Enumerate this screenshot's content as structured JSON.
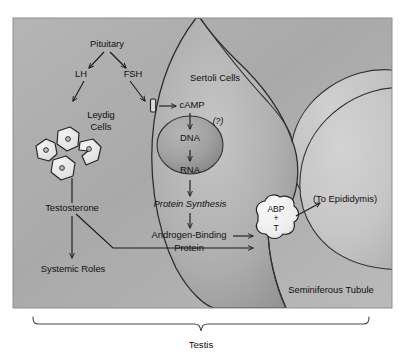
{
  "figure": {
    "caption": "Testis",
    "frame": {
      "x": 13,
      "y": 18,
      "width": 379,
      "height": 290,
      "bg_light": "#c9c9c9",
      "bg_dark": "#9d9d9d",
      "border": "#6f6f6f"
    },
    "bracket": {
      "label": "Testis",
      "color": "#4a4a4a"
    }
  },
  "colors": {
    "interstitium": "#a8a8a8",
    "sertoli_fill": "#b6b6b6",
    "sertoli_shadow": "#8a8a8a",
    "lumen_fill": "#c6c6c6",
    "nucleus_fill": "#9a9a9a",
    "leydig_fill": "#e8e8e8",
    "abp_fill": "#f2f2f2",
    "outline": "#1b1b1b",
    "text": "#101010"
  },
  "labels": {
    "pituitary": "Pituitary",
    "lh": "LH",
    "fsh": "FSH",
    "leydig_line1": "Leydig",
    "leydig_line2": "Cells",
    "sertoli": "Sertoli Cells",
    "camp": "cAMP",
    "question": "(?)",
    "dna": "DNA",
    "rna": "RNA",
    "protein_synthesis": "Protein Synthesis",
    "abp_line1": "Androgen-Binding",
    "abp_line2": "Protein",
    "abp_node_1": "ABP",
    "abp_node_2": "+",
    "abp_node_3": "T",
    "to_epididymis": "(To Epididymis)",
    "seminiferous_tubule": "Seminiferous Tubule",
    "testosterone": "Testosterone",
    "systemic_roles": "Systemic Roles"
  },
  "flow": {
    "pathways": [
      {
        "from": "Pituitary",
        "to": "LH"
      },
      {
        "from": "Pituitary",
        "to": "FSH"
      },
      {
        "from": "LH",
        "to": "Leydig Cells"
      },
      {
        "from": "FSH",
        "to": "FSH receptor on Sertoli cell membrane"
      },
      {
        "from": "FSH receptor",
        "to": "cAMP"
      },
      {
        "from": "cAMP",
        "to": "DNA"
      },
      {
        "from": "DNA",
        "to": "RNA"
      },
      {
        "from": "RNA",
        "to": "Protein Synthesis"
      },
      {
        "from": "Protein Synthesis",
        "to": "Androgen-Binding Protein"
      },
      {
        "from": "Androgen-Binding Protein",
        "to": "ABP + T"
      },
      {
        "from": "Leydig Cells",
        "to": "Testosterone"
      },
      {
        "from": "Testosterone",
        "to": "Systemic Roles"
      },
      {
        "from": "Testosterone",
        "to": "ABP + T"
      },
      {
        "from": "ABP + T",
        "to": "(To Epididymis)"
      }
    ],
    "leydig_cell_count": 4
  }
}
